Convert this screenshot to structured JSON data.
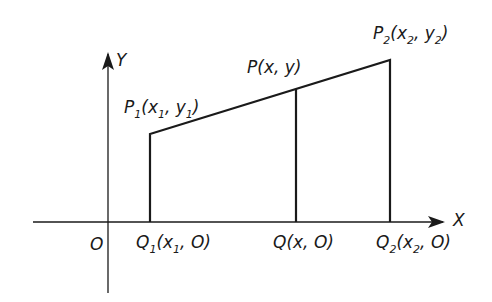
{
  "diagram": {
    "axes": {
      "x_label": "X",
      "y_label": "Y",
      "origin_label": "O"
    },
    "points": {
      "p1": {
        "name": "P",
        "sub": "1",
        "label_parts": [
          "P",
          "1",
          "(x",
          "1",
          ", y",
          "1",
          ")"
        ]
      },
      "p": {
        "name": "P",
        "label": "P(x, y)"
      },
      "p2": {
        "name": "P",
        "sub": "2",
        "label_parts": [
          "P",
          "2",
          "(x",
          "2",
          ", y",
          "2",
          ")"
        ]
      },
      "q1": {
        "name": "Q",
        "sub": "1",
        "label_parts": [
          "Q",
          "1",
          "(x",
          "1",
          ", O)"
        ]
      },
      "q": {
        "name": "Q",
        "label": "Q(x, O)"
      },
      "q2": {
        "name": "Q",
        "sub": "2",
        "label_parts": [
          "Q",
          "2",
          "(x",
          "2",
          ", O)"
        ]
      }
    },
    "labels": {
      "p_main": "P(x, y)",
      "q_main": "Q(x, O)"
    }
  }
}
